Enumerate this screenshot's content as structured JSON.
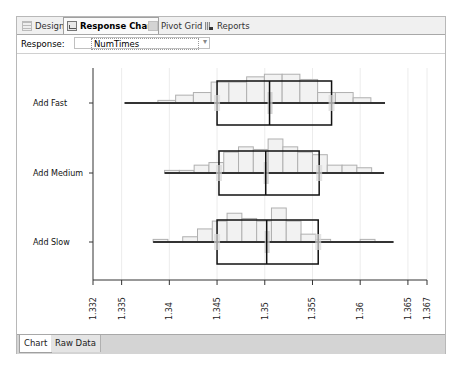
{
  "tabs": [
    {
      "label": "Design",
      "icon": "design-icon",
      "active": false
    },
    {
      "label": "Response Chart",
      "icon": "chart-icon",
      "active": true
    },
    {
      "label": "Pivot Grid",
      "icon": "grid-icon",
      "active": false
    },
    {
      "label": "Reports",
      "icon": "reports-icon",
      "active": false
    }
  ],
  "response": {
    "label": "Response:",
    "value": "NumTimes",
    "dropdown_icon": "chevron-down-icon"
  },
  "bottom_tabs": [
    {
      "label": "Chart",
      "active": true
    },
    {
      "label": "Raw Data",
      "active": false
    }
  ],
  "chart_data": {
    "type": "boxplot_histogram",
    "orientation": "horizontal",
    "title": "",
    "xlabel": "",
    "ylabel": "",
    "xlim": [
      1.332,
      1.367
    ],
    "x_ticks": [
      "1.332",
      "1.335",
      "1.34",
      "1.345",
      "1.35",
      "1.355",
      "1.36",
      "1.365",
      "1.367"
    ],
    "x_tick_values": [
      1.332,
      1.335,
      1.34,
      1.345,
      1.35,
      1.355,
      1.36,
      1.365,
      1.367
    ],
    "grid": true,
    "legend": "none",
    "categories": [
      "Add Fast",
      "Add Medium",
      "Add Slow"
    ],
    "series": [
      {
        "name": "Add Fast",
        "min": 1.3353,
        "q1": 1.345,
        "median": 1.3505,
        "q3": 1.357,
        "max": 1.3626,
        "histogram": {
          "bin_start": 1.3388,
          "bin_width": 0.00186,
          "counts": [
            1,
            3,
            4,
            8,
            8,
            10,
            11,
            11,
            9,
            4,
            4,
            2
          ]
        }
      },
      {
        "name": "Add Medium",
        "min": 1.3395,
        "q1": 1.3452,
        "median": 1.3501,
        "q3": 1.3557,
        "max": 1.3625,
        "histogram": {
          "bin_start": 1.3395,
          "bin_width": 0.00155,
          "counts": [
            1,
            1,
            3,
            4,
            8,
            10,
            9,
            13,
            10,
            8,
            7,
            3,
            3,
            2,
            0
          ]
        }
      },
      {
        "name": "Add Slow",
        "min": 1.3383,
        "q1": 1.345,
        "median": 1.3502,
        "q3": 1.3556,
        "max": 1.3635,
        "histogram": {
          "bin_start": 1.3383,
          "bin_width": 0.00155,
          "counts": [
            1,
            0,
            2,
            5,
            8,
            11,
            9,
            8,
            13,
            8,
            3,
            1,
            0,
            0,
            1,
            0
          ]
        }
      }
    ]
  }
}
